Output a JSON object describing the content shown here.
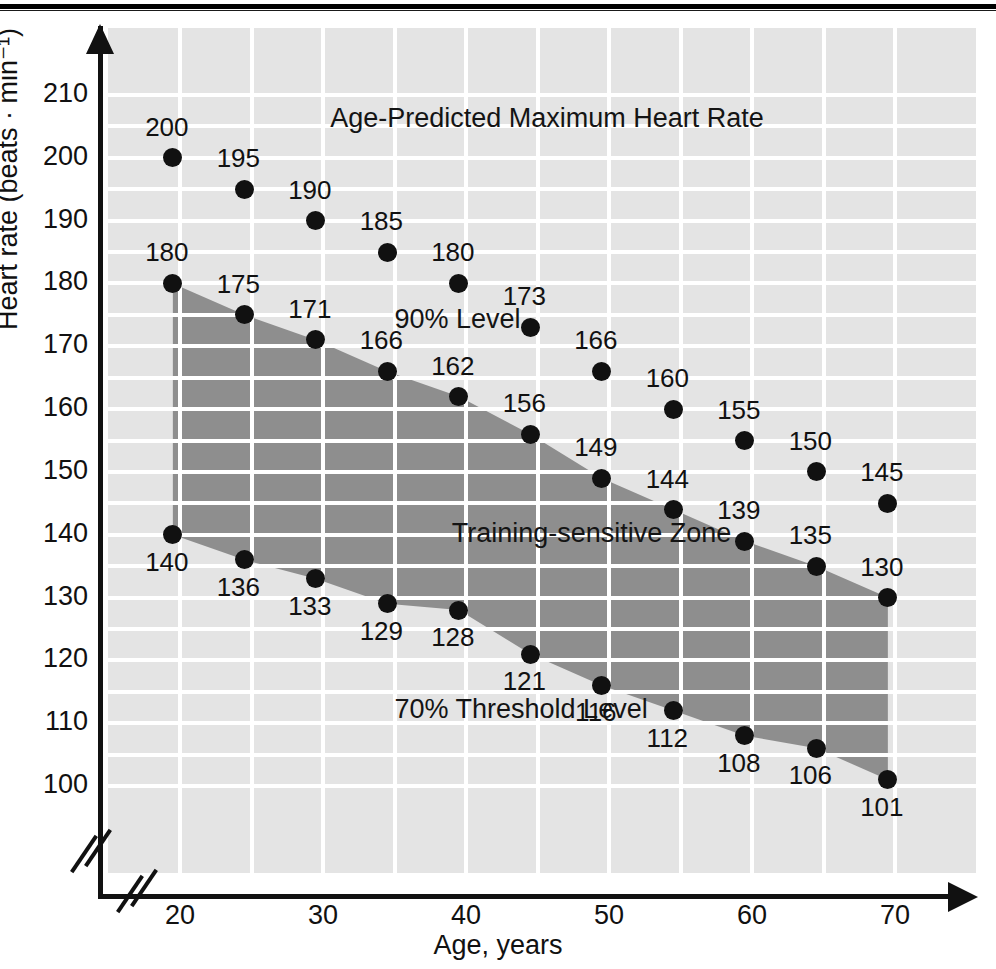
{
  "chart_data": {
    "type": "line",
    "title": "Age-Predicted Maximum Heart Rate",
    "xlabel": "Age, years",
    "ylabel": "Heart rate (beats · min⁻¹)",
    "xlim": [
      17.5,
      73
    ],
    "ylim": [
      93,
      215
    ],
    "xticks": [
      20,
      30,
      40,
      50,
      60,
      70
    ],
    "yticks": [
      100,
      110,
      120,
      130,
      140,
      150,
      160,
      170,
      180,
      190,
      200,
      210
    ],
    "grid": true,
    "axis_break_x": true,
    "axis_break_y": true,
    "legend_position": "inline-annotations",
    "x": [
      19.5,
      24.5,
      29.5,
      34.5,
      39.5,
      44.5,
      49.5,
      54.5,
      59.5,
      64.5,
      69.5
    ],
    "series": [
      {
        "name": "Age-Predicted Maximum Heart Rate",
        "values": [
          200,
          195,
          190,
          185,
          180,
          173,
          166,
          160,
          155,
          150,
          145
        ]
      },
      {
        "name": "90% Level",
        "values": [
          180,
          175,
          171,
          166,
          162,
          156,
          149,
          144,
          139,
          135,
          130
        ]
      },
      {
        "name": "70% Threshold Level",
        "values": [
          140,
          136,
          133,
          129,
          128,
          121,
          116,
          112,
          108,
          106,
          101
        ]
      }
    ],
    "annotations": [
      {
        "text": "Age-Predicted Maximum Heart Rate",
        "x": 30.5,
        "y": 206
      },
      {
        "text": "90% Level",
        "x": 35.0,
        "y": 174
      },
      {
        "text": "Training-sensitive Zone",
        "x": 39.0,
        "y": 140
      },
      {
        "text": "70% Threshold Level",
        "x": 35.0,
        "y": 112
      }
    ],
    "zone_fill": "#8e8e8e",
    "panel_background": "#e4e4e4",
    "gridline_color": "#ffffff",
    "marker_color": "#111111"
  }
}
